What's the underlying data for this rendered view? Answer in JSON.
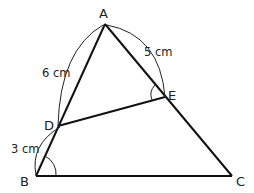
{
  "diagram": {
    "type": "triangle-geometry",
    "points": {
      "A": {
        "label": "A",
        "x": 105,
        "y": 24
      },
      "B": {
        "label": "B",
        "x": 36,
        "y": 176
      },
      "C": {
        "label": "C",
        "x": 232,
        "y": 176
      },
      "D": {
        "label": "D",
        "x": 58,
        "y": 126
      },
      "E": {
        "label": "E",
        "x": 165,
        "y": 97
      }
    },
    "segments": [
      "AB",
      "AC",
      "BC",
      "DE"
    ],
    "measurements": {
      "AD": "6 cm",
      "AE": "5 cm",
      "DB": "3 cm"
    },
    "marked_angles": [
      "angle B",
      "angle AED"
    ],
    "stroke_color": "#111111"
  }
}
